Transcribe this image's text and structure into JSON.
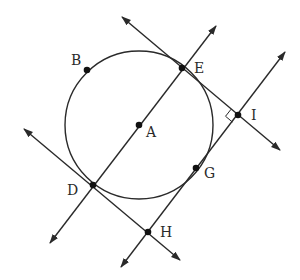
{
  "diagram": {
    "type": "geometry",
    "stroke_color": "#2a2a2a",
    "circle": {
      "center": "A",
      "cx": 139,
      "cy": 125,
      "r": 74
    },
    "points": [
      {
        "id": "A",
        "label": "A",
        "x": 139,
        "y": 125,
        "lx": 146,
        "ly": 137
      },
      {
        "id": "B",
        "label": "B",
        "x": 87,
        "y": 70,
        "lx": 71,
        "ly": 65
      },
      {
        "id": "E",
        "label": "E",
        "x": 182,
        "y": 68,
        "lx": 194,
        "ly": 73
      },
      {
        "id": "I",
        "label": "I",
        "x": 238,
        "y": 115,
        "lx": 251,
        "ly": 120
      },
      {
        "id": "D",
        "label": "D",
        "x": 93,
        "y": 185,
        "lx": 67,
        "ly": 195
      },
      {
        "id": "G",
        "label": "G",
        "x": 196,
        "y": 168,
        "lx": 204,
        "ly": 178
      },
      {
        "id": "H",
        "label": "H",
        "x": 148,
        "y": 232,
        "lx": 160,
        "ly": 237
      }
    ],
    "lines": [
      {
        "name": "line-through-E-I",
        "x1": 122,
        "y1": 17,
        "x2": 280,
        "y2": 150
      },
      {
        "name": "line-through-D-A-E",
        "x1": 50,
        "y1": 243,
        "x2": 216,
        "y2": 26
      },
      {
        "name": "line-through-H-G-I",
        "x1": 121,
        "y1": 267,
        "x2": 285,
        "y2": 52
      },
      {
        "name": "line-through-D-H",
        "x1": 24,
        "y1": 129,
        "x2": 180,
        "y2": 260
      }
    ],
    "right_angle_at": "I"
  }
}
